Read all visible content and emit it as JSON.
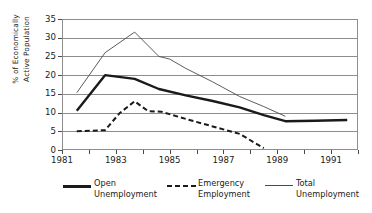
{
  "chart_data": {
    "type": "line",
    "title": "",
    "xlabel": "",
    "ylabel": "% of Economically\nActive Population",
    "xlim": [
      1981,
      1992
    ],
    "ylim": [
      0,
      35
    ],
    "grid": true,
    "legend_position": "bottom",
    "y_ticks": [
      0,
      5,
      10,
      15,
      20,
      25,
      30,
      35
    ],
    "x_ticks": [
      1981,
      1982,
      1983,
      1984,
      1985,
      1986,
      1987,
      1988,
      1989,
      1990,
      1991,
      1992
    ],
    "x_tick_labels": [
      "1981",
      "",
      "1983",
      "",
      "1985",
      "",
      "1987",
      "",
      "1989",
      "",
      "1991",
      ""
    ],
    "series": [
      {
        "name": "Open\nUnemployment",
        "style": "thick-solid",
        "color": "#1a1a1a",
        "x": [
          1981.55,
          1982.6,
          1983.7,
          1984.6,
          1985.6,
          1986.6,
          1987.6,
          1988.5,
          1989.3,
          1990.4,
          1991.6
        ],
        "values": [
          10.5,
          20.0,
          19.0,
          16.3,
          14.6,
          13.1,
          11.4,
          9.3,
          7.7,
          7.8,
          8.0
        ]
      },
      {
        "name": "Emergency\nEmployment",
        "style": "dashed",
        "color": "#1a1a1a",
        "x": [
          1981.55,
          1982.6,
          1983.15,
          1983.7,
          1984.2,
          1984.7,
          1985.6,
          1986.6,
          1987.6,
          1988.5
        ],
        "values": [
          5.0,
          5.3,
          9.9,
          13.0,
          10.4,
          10.2,
          8.3,
          6.3,
          4.3,
          0.5
        ]
      },
      {
        "name": "Total\nUnemployment",
        "style": "thin-solid",
        "color": "#4a4a4a",
        "x": [
          1981.55,
          1982.6,
          1983.7,
          1984.6,
          1985.0,
          1985.6,
          1986.6,
          1987.6,
          1988.5,
          1989.3
        ],
        "values": [
          15.3,
          26.0,
          31.5,
          25.0,
          24.3,
          21.8,
          18.2,
          14.3,
          11.6,
          9.0
        ]
      }
    ]
  },
  "legend": {
    "items": [
      {
        "label": "Open\nUnemployment",
        "style": "thick-solid"
      },
      {
        "label": "Emergency\nEmployment",
        "style": "dashed"
      },
      {
        "label": "Total\nUnemployment",
        "style": "thin-solid"
      }
    ]
  }
}
